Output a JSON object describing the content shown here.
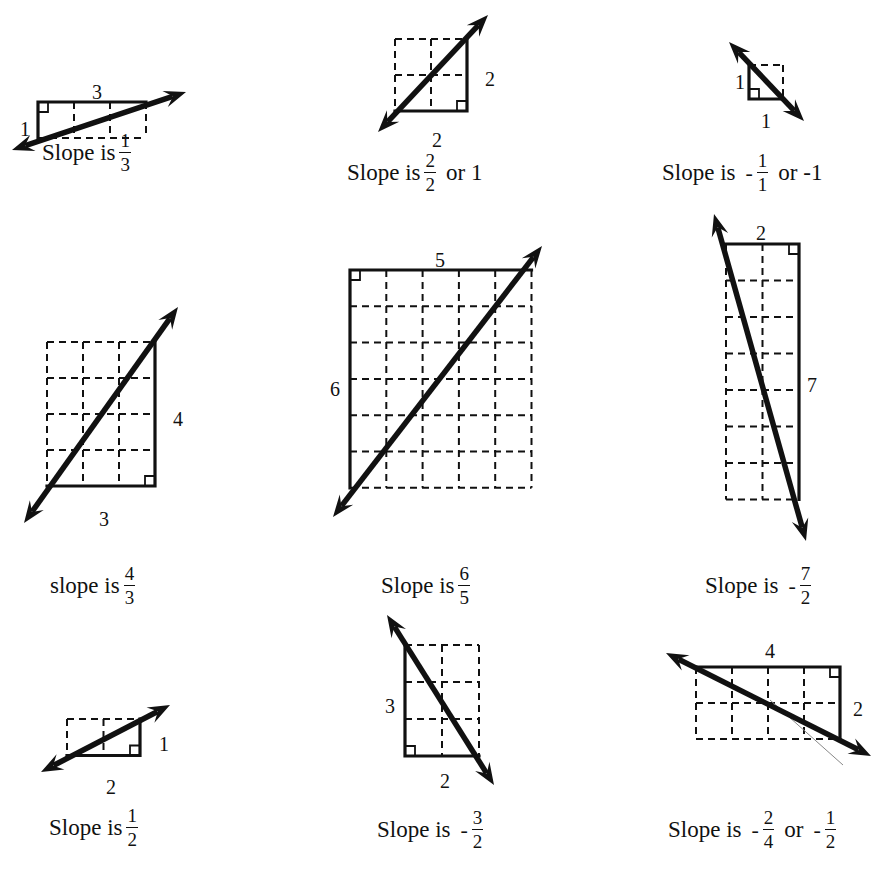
{
  "colors": {
    "ink": "#111111",
    "background": "#ffffff"
  },
  "panels": [
    {
      "id": "p1",
      "run": 3,
      "rise": 1,
      "direction": "positive",
      "grid": {
        "x": 38,
        "y": 102,
        "cell": 36,
        "cols": 3,
        "rows": 1
      },
      "solid": "top-left",
      "right_angle": "top-left",
      "arrow": {
        "x1": 12,
        "y1": 150,
        "x2": 186,
        "y2": 92
      },
      "labels": [
        {
          "text": "3",
          "x": 97,
          "y": 94
        },
        {
          "text": "1",
          "x": 25,
          "y": 131
        }
      ],
      "caption": {
        "x": 42,
        "y": 145,
        "prefix": "Slope is",
        "sign": "",
        "num": "1",
        "den": "3",
        "suffix": ""
      }
    },
    {
      "id": "p2",
      "run": 2,
      "rise": 2,
      "direction": "positive",
      "grid": {
        "x": 395,
        "y": 39,
        "cell": 36,
        "cols": 2,
        "rows": 2
      },
      "solid": "bottom-right",
      "right_angle": "bottom-right",
      "arrow": {
        "x1": 378,
        "y1": 132,
        "x2": 488,
        "y2": 15
      },
      "labels": [
        {
          "text": "2",
          "x": 490,
          "y": 81
        },
        {
          "text": "2",
          "x": 437,
          "y": 142
        }
      ],
      "caption": {
        "x": 347,
        "y": 165,
        "prefix": "Slope is",
        "sign": "",
        "num": "2",
        "den": "2",
        "suffix": "or  1"
      }
    },
    {
      "id": "p3",
      "run": 1,
      "rise": 1,
      "direction": "negative",
      "grid": {
        "x": 749,
        "y": 65,
        "cell": 34,
        "cols": 1,
        "rows": 1
      },
      "solid": "bottom-left",
      "right_angle": "bottom-left",
      "arrow": {
        "x1": 729,
        "y1": 42,
        "x2": 804,
        "y2": 121
      },
      "labels": [
        {
          "text": "1",
          "x": 740,
          "y": 84
        },
        {
          "text": "1",
          "x": 766,
          "y": 123
        }
      ],
      "caption": {
        "x": 662,
        "y": 165,
        "prefix": "Slope is",
        "sign": "-",
        "num": "1",
        "den": "1",
        "suffix": "or  -1"
      }
    },
    {
      "id": "p4",
      "run": 3,
      "rise": 4,
      "direction": "positive",
      "grid": {
        "x": 47,
        "y": 342,
        "cell": 36,
        "cols": 3,
        "rows": 4
      },
      "solid": "bottom-right",
      "right_angle": "bottom-right",
      "arrow": {
        "x1": 24,
        "y1": 523,
        "x2": 178,
        "y2": 307
      },
      "labels": [
        {
          "text": "4",
          "x": 178,
          "y": 421
        },
        {
          "text": "3",
          "x": 104,
          "y": 521
        }
      ],
      "caption": {
        "x": 50,
        "y": 578,
        "prefix": "slope is",
        "sign": "",
        "num": "4",
        "den": "3",
        "suffix": ""
      }
    },
    {
      "id": "p5",
      "run": 5,
      "rise": 6,
      "direction": "positive",
      "grid": {
        "x": 350,
        "y": 270,
        "cell": 36.3,
        "cols": 5,
        "rows": 6
      },
      "solid": "top-left",
      "right_angle": "top-left",
      "arrow": {
        "x1": 333,
        "y1": 517,
        "x2": 542,
        "y2": 246
      },
      "labels": [
        {
          "text": "5",
          "x": 440,
          "y": 262
        },
        {
          "text": "6",
          "x": 335,
          "y": 391
        }
      ],
      "caption": {
        "x": 381,
        "y": 578,
        "prefix": "Slope is",
        "sign": "",
        "num": "6",
        "den": "5",
        "suffix": ""
      }
    },
    {
      "id": "p6",
      "run": 2,
      "rise": 7,
      "direction": "negative",
      "grid": {
        "x": 726,
        "y": 244,
        "cell": 36.5,
        "cols": 2,
        "rows": 7
      },
      "solid": "top-right",
      "right_angle": "top-right",
      "arrow": {
        "x1": 714,
        "y1": 214,
        "x2": 806,
        "y2": 541
      },
      "labels": [
        {
          "text": "2",
          "x": 761,
          "y": 235
        },
        {
          "text": "7",
          "x": 812,
          "y": 387
        }
      ],
      "caption": {
        "x": 705,
        "y": 578,
        "prefix": "Slope is",
        "sign": "-",
        "num": "7",
        "den": "2",
        "suffix": ""
      }
    },
    {
      "id": "p7",
      "run": 2,
      "rise": 1,
      "direction": "positive",
      "grid": {
        "x": 67,
        "y": 719,
        "cell": 36.5,
        "cols": 2,
        "rows": 1
      },
      "solid": "bottom-right",
      "right_angle": "bottom-right",
      "arrow": {
        "x1": 41,
        "y1": 772,
        "x2": 170,
        "y2": 705
      },
      "labels": [
        {
          "text": "1",
          "x": 164,
          "y": 746
        },
        {
          "text": "2",
          "x": 111,
          "y": 789
        }
      ],
      "caption": {
        "x": 49,
        "y": 820,
        "prefix": "Slope is",
        "sign": "",
        "num": "1",
        "den": "2",
        "suffix": ""
      }
    },
    {
      "id": "p8",
      "run": 2,
      "rise": 3,
      "direction": "negative",
      "grid": {
        "x": 405,
        "y": 645,
        "cell": 37,
        "cols": 2,
        "rows": 3
      },
      "solid": "bottom-left",
      "right_angle": "bottom-left",
      "arrow": {
        "x1": 387,
        "y1": 615,
        "x2": 494,
        "y2": 785
      },
      "labels": [
        {
          "text": "3",
          "x": 390,
          "y": 708
        },
        {
          "text": "2",
          "x": 445,
          "y": 783
        }
      ],
      "caption": {
        "x": 377,
        "y": 822,
        "prefix": "Slope is",
        "sign": "-",
        "num": "3",
        "den": "2",
        "suffix": ""
      }
    },
    {
      "id": "p9",
      "run": 4,
      "rise": 2,
      "direction": "negative",
      "grid": {
        "x": 696,
        "y": 667,
        "cell": 36,
        "cols": 4,
        "rows": 2
      },
      "solid": "top-right",
      "right_angle": "top-right",
      "arrow": {
        "x1": 666,
        "y1": 653,
        "x2": 871,
        "y2": 756
      },
      "faint_line": {
        "x1": 770,
        "y1": 700,
        "x2": 843,
        "y2": 765
      },
      "labels": [
        {
          "text": "4",
          "x": 770,
          "y": 653
        },
        {
          "text": "2",
          "x": 858,
          "y": 711
        }
      ],
      "caption": {
        "x": 668,
        "y": 822,
        "prefix": "Slope is",
        "sign": "-",
        "num": "2",
        "den": "4",
        "suffix": "or",
        "sign2": "-",
        "num2": "1",
        "den2": "2"
      }
    }
  ]
}
